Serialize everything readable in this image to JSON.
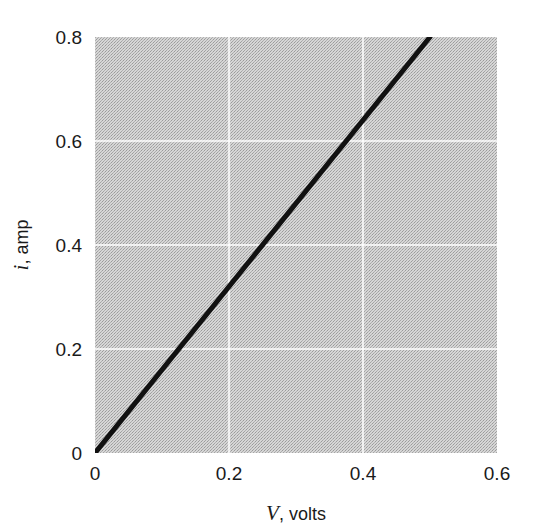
{
  "chart_data": {
    "type": "line",
    "title": "",
    "xlabel": "V, volts",
    "xlabel_var": "V",
    "xlabel_unit": ", volts",
    "ylabel": "i, amp",
    "ylabel_var": "i",
    "ylabel_unit": ", amp",
    "xlim": [
      0,
      0.6
    ],
    "ylim": [
      0,
      0.8
    ],
    "x_ticks": [
      "0",
      "0.2",
      "0.4",
      "0.6"
    ],
    "y_ticks": [
      "0",
      "0.2",
      "0.4",
      "0.6",
      "0.8"
    ],
    "grid": true,
    "legend": null,
    "series": [
      {
        "name": "i vs V",
        "x": [
          0,
          0.5
        ],
        "y": [
          0,
          0.8
        ],
        "color": "#111111"
      }
    ]
  },
  "colors": {
    "plot_background": "#c9c9c9",
    "grid": "#ffffff",
    "line": "#111111"
  }
}
